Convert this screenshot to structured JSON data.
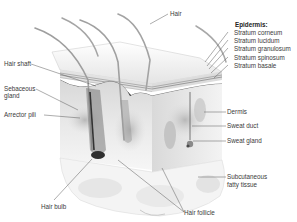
{
  "diagram": {
    "labels": {
      "hair": "Hair",
      "hair_shaft": "Hair shaft",
      "sebaceous_gland_1": "Sebaceous",
      "sebaceous_gland_2": "gland",
      "arrector_pili": "Arrector pili",
      "hair_bulb": "Hair bulb",
      "hair_follicle": "Hair follicle",
      "dermis": "Dermis",
      "sweat_duct": "Sweat duct",
      "sweat_gland": "Sweat gland",
      "subcutaneous_1": "Subcutaneous",
      "subcutaneous_2": "fatty tissue"
    },
    "epidermis": {
      "heading": "Epidermis:",
      "layers": [
        "Stratum corneum",
        "Stratum lucidum",
        "Stratum granulosum",
        "Stratum spinosum",
        "Stratum basale"
      ]
    },
    "colors": {
      "background": "#ffffff",
      "tissue_light": "#efefef",
      "tissue_mid": "#cfcfcf",
      "tissue_dark": "#8a8a8a",
      "leader_line": "#555555",
      "text": "#3a3a3a"
    }
  }
}
